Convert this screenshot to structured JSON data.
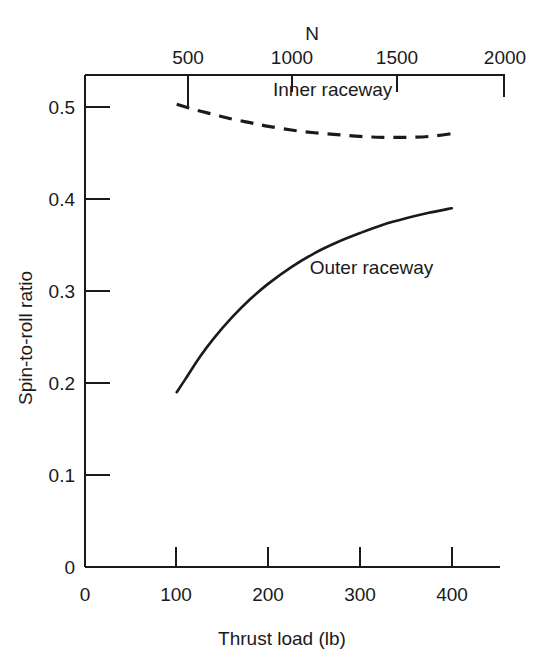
{
  "chart_data": {
    "type": "line",
    "title": "",
    "xlabel": "Thrust load (lb)",
    "ylabel": "Spin-to-roll ratio",
    "top_axis_label": "N",
    "xlim": [
      0,
      450
    ],
    "ylim": [
      0,
      0.53
    ],
    "top_xlim": [
      0,
      2000
    ],
    "grid": false,
    "legend": "inline-annotations",
    "xticks": [
      "0",
      "100",
      "200",
      "300",
      "400"
    ],
    "xtick_values": [
      0,
      100,
      200,
      300,
      400
    ],
    "yticks": [
      "0",
      "0.1",
      "0.2",
      "0.3",
      "0.4",
      "0.5"
    ],
    "ytick_values": [
      0,
      0.1,
      0.2,
      0.3,
      0.4,
      0.5
    ],
    "top_xticks": [
      "500",
      "1000",
      "1500",
      "2000"
    ],
    "top_xtick_values": [
      500,
      1000,
      1500,
      2000
    ],
    "series": [
      {
        "name": "Inner raceway",
        "style": "dashed",
        "color": "#1a1a1a",
        "x": [
          100,
          120,
          140,
          160,
          180,
          200,
          225,
          250,
          275,
          300,
          325,
          350,
          375,
          400,
          405
        ],
        "y": [
          0.503,
          0.497,
          0.492,
          0.487,
          0.483,
          0.479,
          0.475,
          0.472,
          0.47,
          0.468,
          0.467,
          0.467,
          0.468,
          0.471,
          0.472
        ]
      },
      {
        "name": "Outer raceway",
        "style": "solid",
        "color": "#1a1a1a",
        "x": [
          100,
          110,
          125,
          140,
          160,
          180,
          200,
          225,
          250,
          275,
          300,
          325,
          350,
          375,
          400
        ],
        "y": [
          0.19,
          0.205,
          0.228,
          0.248,
          0.271,
          0.291,
          0.308,
          0.326,
          0.341,
          0.353,
          0.363,
          0.372,
          0.379,
          0.385,
          0.39
        ]
      }
    ],
    "annotations": [
      {
        "text": "Inner raceway",
        "x": 205,
        "y": 0.512
      },
      {
        "text": "Outer raceway",
        "x": 245,
        "y": 0.318
      }
    ]
  }
}
